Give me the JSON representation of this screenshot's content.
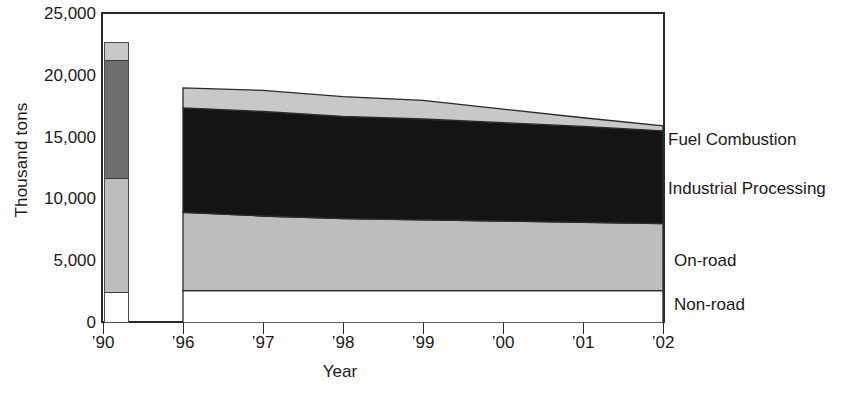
{
  "chart_data": {
    "type": "area",
    "title": "",
    "subtitle": "",
    "xlabel": "Year",
    "ylabel": "Thousand tons",
    "ylim": [
      0,
      25000
    ],
    "yticks": [
      0,
      5000,
      10000,
      15000,
      20000,
      25000
    ],
    "ytick_labels": [
      "0",
      "5,000",
      "10,000",
      "15,000",
      "20,000",
      "25,000"
    ],
    "xtick_labels": [
      "’90",
      "’96",
      "’97",
      "’98",
      "’99",
      "’00",
      "’01",
      "’02"
    ],
    "grid": false,
    "legend_position": "right",
    "legend": [
      "Fuel Combustion",
      "Industrial Processing",
      "On-road",
      "Non-road"
    ],
    "note": "Stacked area for 1996-2002 with a separate single stacked bar for 1990",
    "reference_bar": {
      "year": "’90",
      "total": 22550,
      "segments": [
        {
          "name": "Fuel Combustion",
          "value": 1300,
          "color": "#c8c8c8"
        },
        {
          "name": "Industrial Processing",
          "value": 9600,
          "color": "#6e6e6e"
        },
        {
          "name": "On-road",
          "value": 9250,
          "color": "#bdbdbd"
        },
        {
          "name": "Non-road",
          "value": 2400,
          "color": "#ffffff"
        }
      ]
    },
    "x": [
      "’96",
      "’97",
      "’98",
      "’99",
      "’00",
      "’01",
      "’02"
    ],
    "series": [
      {
        "name": "Non-road",
        "color": "#ffffff",
        "values": [
          2600,
          2600,
          2600,
          2600,
          2600,
          2600,
          2600
        ]
      },
      {
        "name": "On-road",
        "color": "#bdbdbd",
        "values": [
          6300,
          6000,
          5800,
          5700,
          5600,
          5500,
          5400
        ]
      },
      {
        "name": "Industrial Processing",
        "color": "#141414",
        "values": [
          8400,
          8400,
          8200,
          8100,
          7900,
          7700,
          7450
        ]
      },
      {
        "name": "Fuel Combustion",
        "color": "#c8c8c8",
        "values": [
          1600,
          1700,
          1600,
          1500,
          1100,
          700,
          400
        ]
      }
    ],
    "stack_totals": [
      18900,
      18700,
      18200,
      17900,
      17200,
      16500,
      15850
    ],
    "colors": {
      "fuel_combustion": "#c8c8c8",
      "industrial_processing": "#141414",
      "on_road": "#bdbdbd",
      "non_road": "#ffffff",
      "axis": "#2a2a2a",
      "text": "#1a1a1a",
      "background": "#ffffff"
    }
  },
  "axis": {
    "y_title": "Thousand tons",
    "x_title": "Year"
  },
  "legend": {
    "items": [
      {
        "label": "Fuel Combustion"
      },
      {
        "label": "Industrial Processing"
      },
      {
        "label": "On-road"
      },
      {
        "label": "Non-road"
      }
    ]
  }
}
